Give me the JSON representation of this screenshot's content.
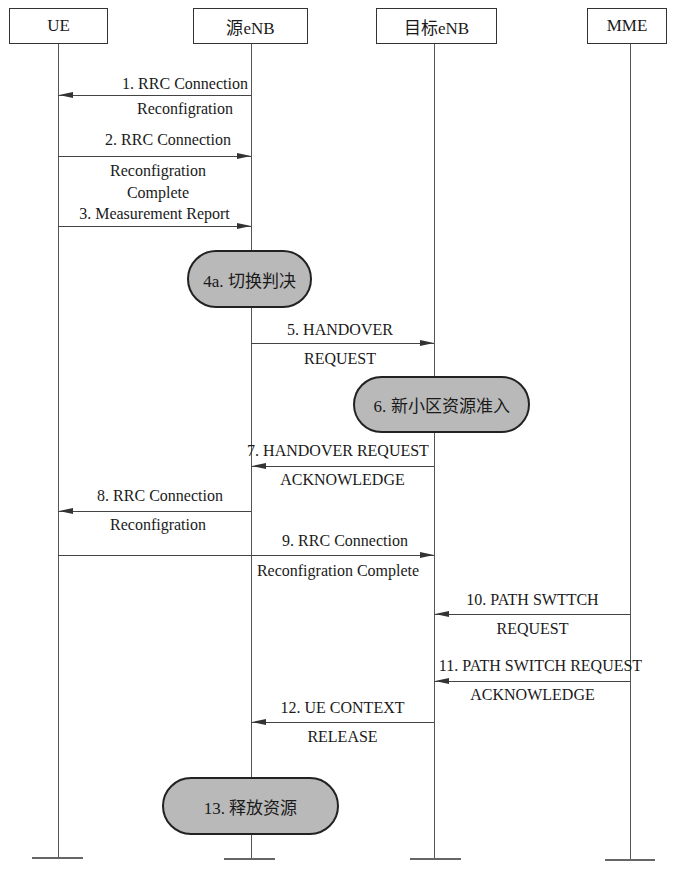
{
  "actors": [
    {
      "id": "ue",
      "label": "UE"
    },
    {
      "id": "src",
      "label": "源eNB"
    },
    {
      "id": "tgt",
      "label": "目标eNB"
    },
    {
      "id": "mme",
      "label": "MME"
    }
  ],
  "messages": [
    {
      "step": "1",
      "from": "源eNB",
      "to": "UE",
      "line1": "1. RRC Connection",
      "line2": "Reconfigration"
    },
    {
      "step": "2",
      "from": "UE",
      "to": "源eNB",
      "line1": "2. RRC Connection",
      "line2": "Reconfigration",
      "line3": "Complete"
    },
    {
      "step": "3",
      "from": "UE",
      "to": "源eNB",
      "line1": "3. Measurement Report"
    },
    {
      "step": "5",
      "from": "源eNB",
      "to": "目标eNB",
      "line1": "5. HANDOVER",
      "line2": "REQUEST"
    },
    {
      "step": "7",
      "from": "目标eNB",
      "to": "源eNB",
      "line1": "7. HANDOVER REQUEST",
      "line2": "ACKNOWLEDGE"
    },
    {
      "step": "8",
      "from": "源eNB",
      "to": "UE",
      "line1": "8. RRC Connection",
      "line2": "Reconfigration"
    },
    {
      "step": "9",
      "from": "UE",
      "to": "目标eNB",
      "line1": "9. RRC Connection",
      "line2": "Reconfigration Complete"
    },
    {
      "step": "10",
      "from": "MME",
      "to": "目标eNB",
      "line1": "10. PATH SWTTCH",
      "line2": "REQUEST"
    },
    {
      "step": "11",
      "from": "MME",
      "to": "目标eNB",
      "line1": "11. PATH SWITCH REQUEST",
      "line2": "ACKNOWLEDGE"
    },
    {
      "step": "12",
      "from": "目标eNB",
      "to": "源eNB",
      "line1": "12. UE CONTEXT",
      "line2": "RELEASE"
    }
  ],
  "actions": [
    {
      "step": "4a",
      "label": "4a. 切换判决",
      "on": "源eNB"
    },
    {
      "step": "6",
      "label": "6. 新小区资源准入",
      "on": "目标eNB"
    },
    {
      "step": "13",
      "label": "13. 释放资源",
      "on": "源eNB"
    }
  ],
  "colors": {
    "pill_fill": "#b9b9b9",
    "line": "#444444"
  }
}
